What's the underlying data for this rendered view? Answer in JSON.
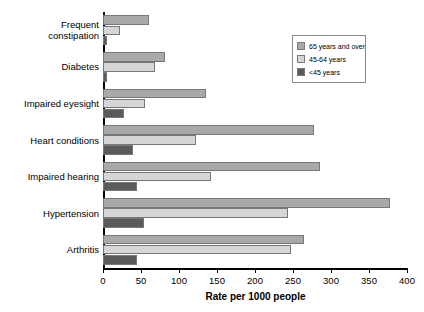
{
  "chart_data": {
    "type": "bar",
    "orientation": "horizontal",
    "title": "",
    "xlabel": "Rate per 1000 people",
    "ylabel": "",
    "xlim": [
      0,
      400
    ],
    "xticks": [
      0,
      50,
      100,
      150,
      200,
      250,
      300,
      350,
      400
    ],
    "grid": false,
    "legend_position": "top-right",
    "categories": [
      "Frequent\nconstipation",
      "Diabetes",
      "Impaired eyesight",
      "Heart conditions",
      "Impaired hearing",
      "Hypertension",
      "Arthritis"
    ],
    "series": [
      {
        "name": "65 years and over",
        "color": "#a9a9a9",
        "values": [
          60,
          82,
          135,
          278,
          285,
          378,
          265
        ]
      },
      {
        "name": "45-64 years",
        "color": "#d6d6d6",
        "values": [
          22,
          68,
          55,
          122,
          142,
          244,
          248
        ]
      },
      {
        "name": "<45 years",
        "color": "#5a5a5a",
        "values": [
          5,
          5,
          28,
          39,
          45,
          54,
          45
        ]
      }
    ]
  },
  "legend": {
    "items": [
      {
        "label": "65 years and over",
        "color": "#a9a9a9"
      },
      {
        "label": "45-64 years",
        "color": "#d6d6d6"
      },
      {
        "label": "<45 years",
        "color": "#5a5a5a"
      }
    ]
  },
  "axis": {
    "x_title": "Rate per 1000 people",
    "tick_labels": [
      "0",
      "50",
      "100",
      "150",
      "200",
      "250",
      "300",
      "350",
      "400"
    ]
  }
}
